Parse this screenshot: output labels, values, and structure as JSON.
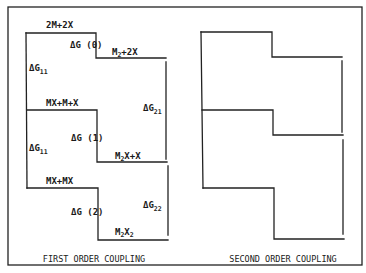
{
  "figure": {
    "frame": {
      "x1": 8,
      "y1": 7,
      "x2": 362,
      "y2": 265
    },
    "line_color": "#222222"
  },
  "first_order": {
    "caption": "FIRST ORDER COUPLING",
    "levels": [
      {
        "left_label": "2M+2X",
        "step_label": "ΔG (0)",
        "right_label": "M₂+2X",
        "right_main": "M",
        "right_sub": "2",
        "right_rest": "+2X"
      },
      {
        "left_label": "MX+M+X",
        "step_label": "ΔG (1)",
        "right_label": "M₂X+X",
        "right_main": "M",
        "right_sub": "2",
        "right_rest": "X+X"
      },
      {
        "left_label": "MX+MX",
        "step_label": "ΔG (2)",
        "right_label": "M₂X₂",
        "right_main": "M",
        "right_sub": "2",
        "right_mid": "X",
        "right_sub2": "2"
      }
    ],
    "side_labels": [
      {
        "main": "ΔG",
        "sub": "11"
      },
      {
        "main": "ΔG",
        "sub": "11"
      },
      {
        "main": "ΔG",
        "sub": "21"
      },
      {
        "main": "ΔG",
        "sub": "22"
      }
    ]
  },
  "second_order": {
    "caption": "SECOND ORDER COUPLING"
  }
}
